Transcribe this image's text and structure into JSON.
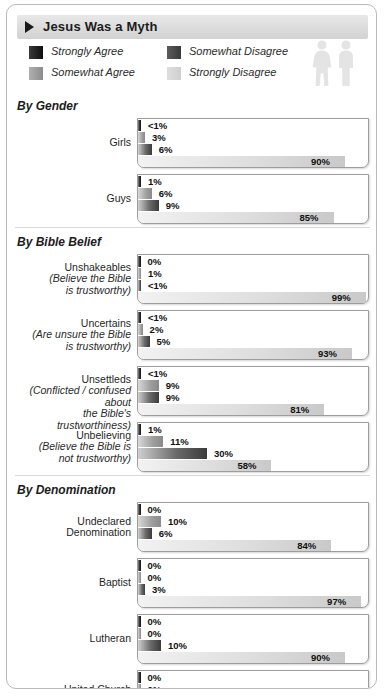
{
  "header": {
    "title": "Jesus Was a Myth",
    "marker_icon": "triangle-right-icon"
  },
  "legend": {
    "items": [
      {
        "label": "Strongly Agree",
        "color": "#1a1a1a"
      },
      {
        "label": "Somewhat Agree",
        "color": "#9e9e9e"
      },
      {
        "label": "Somewhat Disagree",
        "color": "#4a4a4a"
      },
      {
        "label": "Strongly Disagree",
        "color": "#d6d6d6"
      }
    ],
    "decoration_icon": "two-people-icon"
  },
  "chart_data": {
    "type": "bar",
    "title": "Jesus Was a Myth",
    "orientation": "horizontal",
    "stacked": false,
    "xlabel": "",
    "ylabel": "",
    "xlim": [
      0,
      100
    ],
    "grid": false,
    "legend_position": "top",
    "series": [
      {
        "name": "Strongly Agree",
        "color": "#1a1a1a"
      },
      {
        "name": "Somewhat Agree",
        "color": "#9e9e9e"
      },
      {
        "name": "Somewhat Disagree",
        "color": "#4a4a4a"
      },
      {
        "name": "Strongly Disagree",
        "color": "#d6d6d6"
      }
    ],
    "sections": [
      {
        "title": "By Gender",
        "rows": [
          {
            "label": "Girls",
            "sub": "",
            "labels": [
              "<1%",
              "3%",
              "6%",
              "90%"
            ],
            "values": [
              0.5,
              3,
              6,
              90
            ]
          },
          {
            "label": "Guys",
            "sub": "",
            "labels": [
              "1%",
              "6%",
              "9%",
              "85%"
            ],
            "values": [
              1,
              6,
              9,
              85
            ]
          }
        ]
      },
      {
        "title": "By Bible Belief",
        "rows": [
          {
            "label": "Unshakeables",
            "sub": "(Believe the Bible\nis trustworthy)",
            "labels": [
              "0%",
              "1%",
              "<1%",
              "99%"
            ],
            "values": [
              0,
              1,
              0.5,
              99
            ]
          },
          {
            "label": "Uncertains",
            "sub": "(Are unsure the Bible\nis trustworthy)",
            "labels": [
              "<1%",
              "2%",
              "5%",
              "93%"
            ],
            "values": [
              0.5,
              2,
              5,
              93
            ]
          },
          {
            "label": "Unsettleds",
            "sub": "(Conflicted / confused about\nthe Bible's trustworthiness)",
            "labels": [
              "<1%",
              "9%",
              "9%",
              "81%"
            ],
            "values": [
              0.5,
              9,
              9,
              81
            ]
          },
          {
            "label": "Unbelieving",
            "sub": "(Believe the Bible is\nnot trustworthy)",
            "labels": [
              "1%",
              "11%",
              "30%",
              "58%"
            ],
            "values": [
              1,
              11,
              30,
              58
            ]
          }
        ]
      },
      {
        "title": "By Denomination",
        "rows": [
          {
            "label": "Undeclared\nDenomination",
            "sub": "",
            "labels": [
              "0%",
              "10%",
              "6%",
              "84%"
            ],
            "values": [
              0,
              10,
              6,
              84
            ]
          },
          {
            "label": "Baptist",
            "sub": "",
            "labels": [
              "0%",
              "0%",
              "3%",
              "97%"
            ],
            "values": [
              0,
              0,
              3,
              97
            ]
          },
          {
            "label": "Lutheran",
            "sub": "",
            "labels": [
              "0%",
              "0%",
              "10%",
              "90%"
            ],
            "values": [
              0,
              0,
              10,
              90
            ]
          },
          {
            "label": "United Church\nof Christ",
            "sub": "",
            "labels": [
              "0%",
              "0%",
              "13%",
              "88%"
            ],
            "values": [
              0,
              0,
              13,
              88
            ]
          },
          {
            "label": "Believe Jesus\nis not God",
            "sub": "",
            "italic_word": "not",
            "labels": [
              "1%",
              "9%",
              "15%",
              "75%"
            ],
            "values": [
              1,
              9,
              15,
              75
            ]
          }
        ]
      }
    ]
  }
}
